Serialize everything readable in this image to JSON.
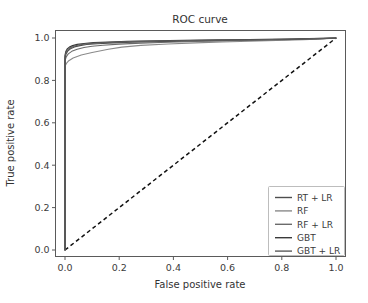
{
  "chart_data": {
    "type": "line",
    "title": "ROC curve",
    "xlabel": "False positive rate",
    "ylabel": "True positive rate",
    "xlim": [
      0.0,
      1.0
    ],
    "ylim": [
      0.0,
      1.0
    ],
    "xticks": [
      "0.0",
      "0.2",
      "0.4",
      "0.6",
      "0.8",
      "1.0"
    ],
    "yticks": [
      "0.0",
      "0.2",
      "0.4",
      "0.6",
      "0.8",
      "1.0"
    ],
    "xtick_values": [
      0.0,
      0.2,
      0.4,
      0.6,
      0.8,
      1.0
    ],
    "ytick_values": [
      0.0,
      0.2,
      0.4,
      0.6,
      0.8,
      1.0
    ],
    "grid": false,
    "legend_position": "lower right",
    "series": [
      {
        "name": "RT + LR",
        "color": "#4e4e4e",
        "linewidth": 1.1,
        "x": [
          0.0,
          0.0,
          0.004,
          0.01,
          0.02,
          0.035,
          0.055,
          0.08,
          0.12,
          0.18,
          0.25,
          0.35,
          0.45,
          0.55,
          0.65,
          0.75,
          0.85,
          0.93,
          1.0
        ],
        "y": [
          0.0,
          0.905,
          0.925,
          0.938,
          0.949,
          0.958,
          0.964,
          0.969,
          0.973,
          0.977,
          0.98,
          0.983,
          0.985,
          0.987,
          0.989,
          0.991,
          0.993,
          0.996,
          1.0
        ]
      },
      {
        "name": "RF",
        "color": "#8a8a8a",
        "linewidth": 1.1,
        "x": [
          0.0,
          0.0,
          0.006,
          0.014,
          0.03,
          0.06,
          0.1,
          0.16,
          0.21,
          0.28,
          0.38,
          0.48,
          0.58,
          0.68,
          0.78,
          0.88,
          0.95,
          1.0
        ],
        "y": [
          0.0,
          0.868,
          0.881,
          0.893,
          0.906,
          0.92,
          0.932,
          0.947,
          0.957,
          0.965,
          0.972,
          0.977,
          0.981,
          0.985,
          0.988,
          0.992,
          0.996,
          1.0
        ]
      },
      {
        "name": "RF + LR",
        "color": "#6b6b6b",
        "linewidth": 1.1,
        "x": [
          0.0,
          0.0,
          0.005,
          0.012,
          0.025,
          0.045,
          0.07,
          0.1,
          0.14,
          0.2,
          0.28,
          0.38,
          0.48,
          0.6,
          0.72,
          0.84,
          0.93,
          1.0
        ],
        "y": [
          0.0,
          0.893,
          0.912,
          0.925,
          0.937,
          0.947,
          0.955,
          0.961,
          0.966,
          0.971,
          0.976,
          0.98,
          0.984,
          0.987,
          0.99,
          0.993,
          0.996,
          1.0
        ]
      },
      {
        "name": "GBT",
        "color": "#3a3a3a",
        "linewidth": 1.2,
        "x": [
          0.0,
          0.0,
          0.003,
          0.008,
          0.016,
          0.028,
          0.045,
          0.07,
          0.105,
          0.16,
          0.23,
          0.33,
          0.44,
          0.56,
          0.68,
          0.8,
          0.9,
          1.0
        ],
        "y": [
          0.0,
          0.918,
          0.936,
          0.948,
          0.957,
          0.964,
          0.97,
          0.974,
          0.978,
          0.981,
          0.984,
          0.987,
          0.989,
          0.991,
          0.993,
          0.995,
          0.997,
          1.0
        ]
      },
      {
        "name": "GBT + LR",
        "color": "#5c5c5c",
        "linewidth": 1.1,
        "x": [
          0.0,
          0.0,
          0.0035,
          0.009,
          0.018,
          0.032,
          0.05,
          0.075,
          0.11,
          0.17,
          0.24,
          0.34,
          0.46,
          0.58,
          0.7,
          0.82,
          0.92,
          1.0
        ],
        "y": [
          0.0,
          0.912,
          0.931,
          0.943,
          0.953,
          0.961,
          0.967,
          0.972,
          0.976,
          0.98,
          0.983,
          0.986,
          0.988,
          0.99,
          0.992,
          0.994,
          0.997,
          1.0
        ]
      }
    ],
    "reference_line": {
      "name": "chance",
      "style": "dashed",
      "color": "#111111",
      "x": [
        0.0,
        1.0
      ],
      "y": [
        0.0,
        1.0
      ]
    },
    "legend_entries": [
      "RT + LR",
      "RF",
      "RF + LR",
      "GBT",
      "GBT + LR"
    ]
  }
}
